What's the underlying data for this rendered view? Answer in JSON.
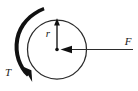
{
  "figure": {
    "kind": "physics-free-body-diagram",
    "background_color": "#ffffff",
    "ink_color": "#1a1a1a",
    "width": 138,
    "height": 91
  },
  "labels": {
    "radius": "r",
    "force": "F",
    "torque": "T"
  },
  "geometry": {
    "disk": {
      "cx": 57,
      "cy": 49.5,
      "r": 29.5
    },
    "center_dot": {
      "cx": 57,
      "cy": 49.5,
      "r": 1.6
    },
    "radius_arrow": {
      "x": 57,
      "y_start": 49.5,
      "y_end": 20.5,
      "direction": "up"
    },
    "force_arrow": {
      "y": 49.5,
      "x_start": 133,
      "x_end": 62,
      "direction": "left"
    },
    "torque_arc": {
      "start": {
        "x": 43,
        "y": 8
      },
      "end": {
        "x": 31,
        "y": 79
      },
      "sweep": "counterclockwise",
      "arrowhead": {
        "x": 30,
        "y": 81
      }
    }
  },
  "label_positions": {
    "radius": {
      "x": 48,
      "y": 37
    },
    "force": {
      "x": 124,
      "y": 45
    },
    "torque": {
      "x": 4,
      "y": 76
    }
  }
}
